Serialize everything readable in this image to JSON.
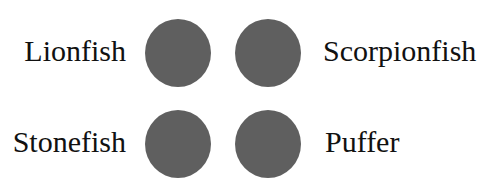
{
  "items": [
    {
      "label": "Lionfish",
      "position": "top-left"
    },
    {
      "label": "Scorpionfish",
      "position": "top-right"
    },
    {
      "label": "Stonefish",
      "position": "bottom-left"
    },
    {
      "label": "Puffer",
      "position": "bottom-right"
    }
  ],
  "circle_color": "#5f5f5f"
}
